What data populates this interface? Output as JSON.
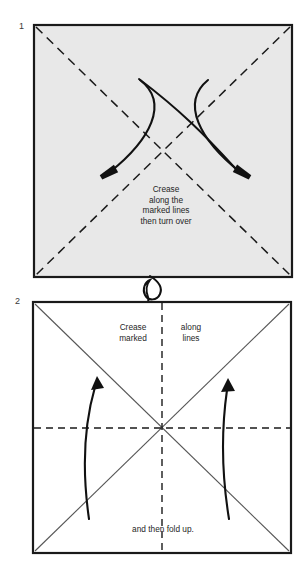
{
  "page": {
    "background_color": "#ffffff",
    "width": 306,
    "height": 583
  },
  "steps": [
    {
      "number": "1",
      "panel": {
        "fill_color": "#e8e8e8",
        "stroke_color": "#1a1a1a",
        "x": 34,
        "y": 25,
        "width": 258,
        "height": 252
      },
      "crease_lines": [
        {
          "style": "dashed",
          "from": "top-left",
          "to": "bottom-right"
        },
        {
          "style": "dashed",
          "from": "top-right",
          "to": "bottom-left"
        }
      ],
      "arrows": [
        {
          "name": "fold-arrow-left",
          "direction": "down-left",
          "style": "curved"
        },
        {
          "name": "fold-arrow-right",
          "direction": "down-right",
          "style": "curved"
        }
      ],
      "caption": "Crease\nalong the\nmarked lines\nthen turn over"
    },
    {
      "number": "2",
      "panel": {
        "fill_color": "#ffffff",
        "stroke_color": "#1a1a1a",
        "x": 33,
        "y": 302,
        "width": 258,
        "height": 251
      },
      "crease_lines": [
        {
          "style": "solid",
          "from": "top-left",
          "to": "bottom-right"
        },
        {
          "style": "solid",
          "from": "top-right",
          "to": "bottom-left"
        },
        {
          "style": "dashed",
          "orientation": "vertical"
        },
        {
          "style": "dashed",
          "orientation": "horizontal"
        }
      ],
      "arrows": [
        {
          "name": "fold-up-arrow-left",
          "direction": "up",
          "style": "curved"
        },
        {
          "name": "fold-up-arrow-right",
          "direction": "up",
          "style": "curved"
        }
      ],
      "caption_left": "Crease\nmarked",
      "caption_right": "along\nlines",
      "caption_bottom": "and then fold up."
    }
  ],
  "turn_over_symbol": {
    "name": "turn-over-loop-arrow",
    "description": "looped arrow indicating turn the paper over",
    "color": "#111111"
  }
}
